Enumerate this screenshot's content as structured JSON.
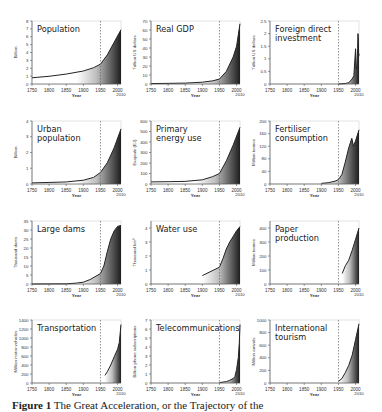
{
  "caption": {
    "label": "Figure 1",
    "text": "The Great Acceleration, or the Trajectory of the"
  },
  "x_axis": {
    "ticks": [
      "1750",
      "1800",
      "1850",
      "1900",
      "1950",
      "2000"
    ],
    "extra_tick": "2010",
    "xlabel": "Year",
    "range": [
      1750,
      2010
    ],
    "marker_year": 1950
  },
  "colors": {
    "line": "#222222",
    "fill_dark": "#1e1e1e",
    "fill_light": "#ffffff",
    "axis": "#555555",
    "dashed": "#666666",
    "text": "#333333"
  },
  "chart_data": [
    {
      "type": "area",
      "title": "Population",
      "title_lines": [
        "Population"
      ],
      "xlabel": "Year",
      "ylabel": "Billion",
      "ylim": [
        0,
        8
      ],
      "yticks": [
        "0",
        "1",
        "2",
        "3",
        "4",
        "5",
        "6",
        "7",
        "8"
      ],
      "x": [
        1750,
        1800,
        1850,
        1900,
        1930,
        1950,
        1970,
        1990,
        2010
      ],
      "values": [
        0.79,
        0.98,
        1.26,
        1.65,
        2.07,
        2.52,
        3.7,
        5.3,
        6.9
      ]
    },
    {
      "type": "area",
      "title": "Real GDP",
      "title_lines": [
        "Real GDP"
      ],
      "xlabel": "Year",
      "ylabel": "Trillion US dollars",
      "ylim": [
        0,
        70
      ],
      "yticks": [
        "0",
        "10",
        "20",
        "30",
        "40",
        "50",
        "60",
        "70"
      ],
      "x": [
        1750,
        1800,
        1850,
        1900,
        1930,
        1950,
        1970,
        1990,
        2000,
        2010
      ],
      "values": [
        0.5,
        0.7,
        1.0,
        2.0,
        3.5,
        5.5,
        14,
        30,
        42,
        67
      ]
    },
    {
      "type": "area",
      "title": "Foreign direct investment",
      "title_lines": [
        "Foreign direct",
        "investment"
      ],
      "xlabel": "Year",
      "ylabel": "Trillion US dollars",
      "ylim": [
        0,
        2.5
      ],
      "yticks": [
        "0",
        "0.5",
        "1",
        "1.5",
        "2",
        "2.5"
      ],
      "x": [
        1950,
        1970,
        1980,
        1990,
        1995,
        2000,
        2002,
        2004,
        2006,
        2007,
        2008,
        2009,
        2010
      ],
      "values": [
        0.0,
        0.02,
        0.05,
        0.2,
        0.33,
        1.4,
        0.6,
        0.7,
        1.4,
        2.0,
        1.8,
        1.1,
        1.2
      ]
    },
    {
      "type": "area",
      "title": "Urban population",
      "title_lines": [
        "Urban",
        "population"
      ],
      "xlabel": "Year",
      "ylabel": "Billion",
      "ylim": [
        0,
        4
      ],
      "yticks": [
        "0",
        "1",
        "2",
        "3",
        "4"
      ],
      "x": [
        1750,
        1800,
        1850,
        1900,
        1930,
        1950,
        1970,
        1990,
        2010
      ],
      "values": [
        0.07,
        0.1,
        0.13,
        0.24,
        0.42,
        0.73,
        1.35,
        2.3,
        3.5
      ]
    },
    {
      "type": "area",
      "title": "Primary energy use",
      "title_lines": [
        "Primary",
        "energy use"
      ],
      "xlabel": "Year",
      "ylabel": "Exajoule (EJ)",
      "ylim": [
        0,
        600
      ],
      "yticks": [
        "0",
        "100",
        "200",
        "300",
        "400",
        "500",
        "600"
      ],
      "x": [
        1750,
        1800,
        1850,
        1900,
        1930,
        1950,
        1970,
        1990,
        2010
      ],
      "values": [
        20,
        22,
        25,
        40,
        70,
        100,
        220,
        370,
        540
      ]
    },
    {
      "type": "area",
      "title": "Fertiliser consumption",
      "title_lines": [
        "Fertiliser",
        "consumption"
      ],
      "xlabel": "Year",
      "ylabel": "Million tonnes",
      "ylim": [
        0,
        200
      ],
      "yticks": [
        "0",
        "40",
        "80",
        "120",
        "160",
        "200"
      ],
      "x": [
        1900,
        1920,
        1940,
        1950,
        1960,
        1970,
        1980,
        1989,
        1994,
        2000,
        2010
      ],
      "values": [
        2,
        4,
        9,
        14,
        30,
        70,
        115,
        145,
        120,
        137,
        172
      ]
    },
    {
      "type": "area",
      "title": "Large dams",
      "title_lines": [
        "Large dams"
      ],
      "xlabel": "Year",
      "ylabel": "Thousand dams",
      "ylim": [
        0,
        35
      ],
      "yticks": [
        "0",
        "5",
        "10",
        "15",
        "20",
        "25",
        "30",
        "35"
      ],
      "x": [
        1750,
        1800,
        1850,
        1880,
        1900,
        1920,
        1950,
        1960,
        1970,
        1980,
        1990,
        2000,
        2010
      ],
      "values": [
        0.0,
        0.05,
        0.1,
        0.5,
        1.0,
        2.5,
        5.8,
        10,
        18,
        25,
        29.5,
        32,
        32.5
      ]
    },
    {
      "type": "area",
      "title": "Water use",
      "title_lines": [
        "Water use"
      ],
      "xlabel": "Year",
      "ylabel": "Thousand km³",
      "ylim": [
        0,
        4.5
      ],
      "yticks": [
        "0",
        "1",
        "2",
        "3",
        "4"
      ],
      "x": [
        1900,
        1950,
        1960,
        1970,
        1980,
        1990,
        2000,
        2010
      ],
      "values": [
        0.6,
        1.2,
        1.8,
        2.5,
        3.0,
        3.4,
        3.8,
        4.1
      ]
    },
    {
      "type": "area",
      "title": "Paper production",
      "title_lines": [
        "Paper",
        "production"
      ],
      "xlabel": "Year",
      "ylabel": "Million tonnes",
      "ylim": [
        0,
        450
      ],
      "yticks": [
        "0",
        "100",
        "200",
        "300",
        "400"
      ],
      "x": [
        1961,
        1970,
        1980,
        1990,
        2000,
        2010
      ],
      "values": [
        75,
        130,
        170,
        240,
        320,
        400
      ]
    },
    {
      "type": "area",
      "title": "Transportation",
      "title_lines": [
        "Transportation"
      ],
      "xlabel": "Year",
      "ylabel": "Million motor vehicles",
      "ylim": [
        0,
        1400
      ],
      "yticks": [
        "0",
        "200",
        "400",
        "600",
        "800",
        "1000",
        "1200",
        "1400"
      ],
      "x": [
        1963,
        1970,
        1980,
        1990,
        2000,
        2005,
        2010
      ],
      "values": [
        170,
        250,
        400,
        580,
        750,
        900,
        1300
      ]
    },
    {
      "type": "area",
      "title": "Telecommunications",
      "title_lines": [
        "Telecommunications"
      ],
      "xlabel": "Year",
      "ylabel": "Billion phone subscriptions",
      "ylim": [
        0,
        7
      ],
      "yticks": [
        "0",
        "1",
        "2",
        "3",
        "4",
        "5",
        "6",
        "7"
      ],
      "x": [
        1950,
        1970,
        1980,
        1990,
        1995,
        2000,
        2005,
        2008,
        2010
      ],
      "values": [
        0.05,
        0.15,
        0.3,
        0.5,
        0.7,
        1.5,
        2.8,
        4.5,
        6.5
      ]
    },
    {
      "type": "area",
      "title": "International tourism",
      "title_lines": [
        "International",
        "tourism"
      ],
      "xlabel": "Year",
      "ylabel": "Million arrivals",
      "ylim": [
        0,
        1000
      ],
      "yticks": [
        "0",
        "200",
        "400",
        "600",
        "800",
        "1000"
      ],
      "x": [
        1950,
        1960,
        1970,
        1980,
        1990,
        2000,
        2010
      ],
      "values": [
        25,
        70,
        165,
        280,
        440,
        690,
        940
      ]
    }
  ]
}
